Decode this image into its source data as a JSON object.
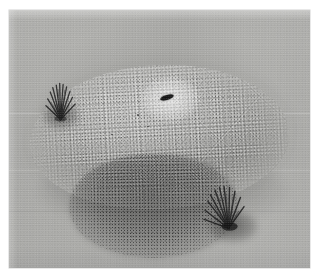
{
  "page": {
    "kind": "scanned-photograph",
    "background_color": "#ffffff"
  },
  "photo": {
    "caption": "",
    "palette": {
      "paper_white": "#ffffff",
      "ground_grey": "#a9a9a7",
      "ground_light": "#b4b4b1",
      "mound_light": "#b6b6b3",
      "mound_mid": "#a9a9a6",
      "mound_shadow": "#9d9d9a",
      "speck_dark": "#282828",
      "speck_light": "#ffffff",
      "tuft_dark": "#262626",
      "hole_black": "#121212"
    },
    "subject": {
      "name": "gravel mound",
      "description": "low broad oval mound covered in fine gravel speckle"
    },
    "features": [
      {
        "id": "entrance-hole",
        "label": "entrance hole",
        "description": "small dark elongated opening near the upper centre of the mound, ringed by a pale halo"
      },
      {
        "id": "dark-gravel-patch",
        "label": "dark gravel patch",
        "description": "denser darker speckled area on the lower front slope of the mound"
      },
      {
        "id": "tuft-left",
        "label": "grass tuft (upper left)",
        "description": "dark fan of bristles on the left rim of the mound"
      },
      {
        "id": "tuft-right",
        "label": "grass tuft (lower right)",
        "description": "dark fan of bristles with cast shadow on the lower right edge of the mound"
      },
      {
        "id": "ground",
        "label": "ground",
        "description": "flat smooth grey ground surrounding the mound"
      }
    ]
  }
}
